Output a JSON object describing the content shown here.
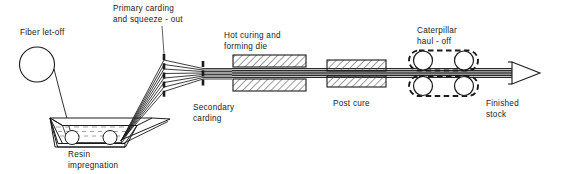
{
  "diagram": {
    "stroke_color": "#1a1a1a",
    "hatch_color": "#555555",
    "background": "#ffffff",
    "labels": {
      "fiber_let_off": "Fiber let-off",
      "primary_carding": "Primary carding\nand squeeze - out",
      "secondary_carding": "Secondary\ncarding",
      "resin_impregnation": "Resin\nimpregnation",
      "hot_curing_die": "Hot curing and\nforming die",
      "post_cure": "Post cure",
      "caterpillar_haul_off": "Caterpillar\nhaul - off",
      "finished_stock": "Finished\nstock"
    },
    "stations": [
      {
        "id": "fiber-let-off-spool",
        "kind": "circle-spool"
      },
      {
        "id": "resin-bath",
        "kind": "trapezoid-tank",
        "rollers": 2
      },
      {
        "id": "primary-carding-plate",
        "kind": "vertical-dashed-bar"
      },
      {
        "id": "secondary-carding-plate",
        "kind": "vertical-dashed-bar"
      },
      {
        "id": "hot-curing-die",
        "kind": "hatched-block-pair"
      },
      {
        "id": "post-cure",
        "kind": "hatched-block-pair"
      },
      {
        "id": "caterpillar-haul-off",
        "kind": "dashed-belt-roller-pair",
        "tracks": 2,
        "rollers_per_track": 2
      },
      {
        "id": "finished-stock-arrow",
        "kind": "open-arrowhead"
      }
    ]
  }
}
